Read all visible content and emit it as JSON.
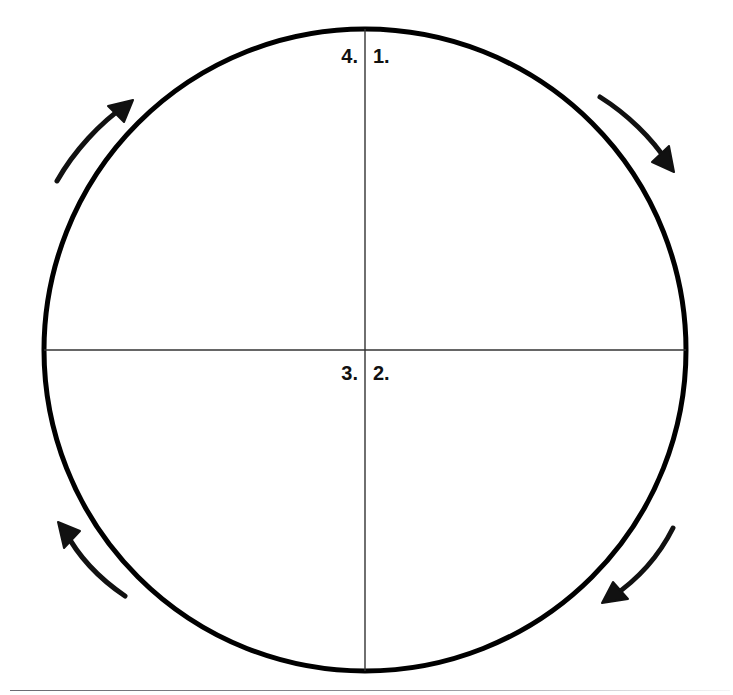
{
  "diagram": {
    "type": "quadrant-cycle-circle",
    "title": "",
    "circle": {
      "center_x": 365,
      "center_y": 350,
      "radius": 321,
      "stroke_color": "#000000",
      "stroke_width": 5,
      "fill": "none"
    },
    "axes": {
      "stroke_color": "#333333",
      "stroke_width": 1.4,
      "vertical": {
        "x": 365,
        "y1": 29,
        "y2": 671
      },
      "horizontal": {
        "y": 350,
        "x1": 44,
        "x2": 686
      }
    },
    "quadrant_labels": [
      {
        "id": "label-1",
        "text": "1.",
        "quadrant": "top-right"
      },
      {
        "id": "label-2",
        "text": "2.",
        "quadrant": "bottom-right"
      },
      {
        "id": "label-3",
        "text": "3.",
        "quadrant": "bottom-left"
      },
      {
        "id": "label-4",
        "text": "4.",
        "quadrant": "top-left"
      }
    ],
    "arrows": {
      "direction": "clockwise",
      "count": 4,
      "color": "#111111",
      "stroke_width": 5,
      "items": [
        {
          "name": "arrow-top-left",
          "points_toward": "up-right"
        },
        {
          "name": "arrow-top-right",
          "points_toward": "down-right"
        },
        {
          "name": "arrow-bottom-right",
          "points_toward": "down-left"
        },
        {
          "name": "arrow-bottom-left",
          "points_toward": "up-left"
        }
      ]
    },
    "footer_rule": {
      "color": "#6b6b72",
      "visible": true
    }
  }
}
